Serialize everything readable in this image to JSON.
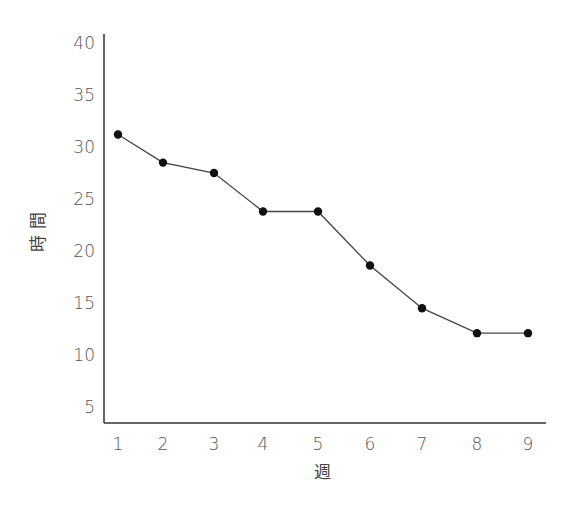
{
  "chart_data": {
    "type": "line",
    "title": "",
    "xlabel": "週",
    "ylabel": "時間",
    "x": [
      1,
      2,
      3,
      4,
      5,
      6,
      7,
      8,
      9
    ],
    "categories": [
      "1",
      "2",
      "3",
      "4",
      "5",
      "6",
      "7",
      "8",
      "9"
    ],
    "series": [
      {
        "name": "時間",
        "values": [
          31.2,
          28.5,
          27.5,
          23.8,
          23.8,
          18.6,
          14.5,
          12.1,
          12.1
        ]
      }
    ],
    "yticks": [
      5,
      10,
      15,
      20,
      25,
      30,
      35,
      40
    ],
    "ylim": [
      3.5,
      40
    ],
    "grid": false,
    "legend": null,
    "marker": "filled-circle",
    "line_color": "#444444",
    "marker_color": "#111111",
    "axis_color": "#333333"
  }
}
